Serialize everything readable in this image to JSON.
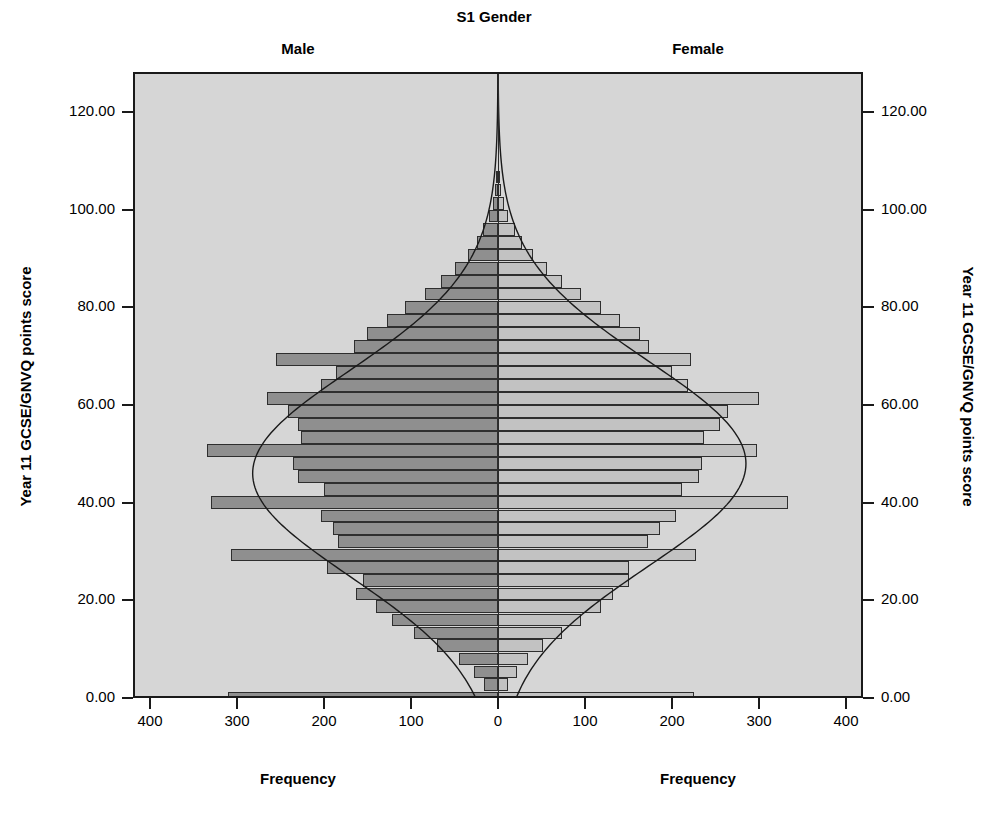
{
  "chart": {
    "title": "S1 Gender",
    "panels": [
      {
        "key": "male",
        "label": "Male",
        "xlabel": "Frequency"
      },
      {
        "key": "female",
        "label": "Female",
        "xlabel": "Frequency"
      }
    ],
    "y_axis_title_left": "Year 11 GCSE/GNVQ points score",
    "y_axis_title_right": "Year 11 GCSE/GNVQ points score",
    "y_ticks": [
      "0.00",
      "20.00",
      "40.00",
      "60.00",
      "80.00",
      "100.00",
      "120.00"
    ],
    "x_ticks_male": [
      "400",
      "300",
      "200",
      "100",
      "0"
    ],
    "x_ticks_female": [
      "0",
      "100",
      "200",
      "300",
      "400"
    ],
    "colors": {
      "male_bar": "#8f8f8f",
      "female_bar": "#c2c2c2",
      "bar_outline": "#2e2e2e",
      "plot_background": "#d6d6d6",
      "frame": "#1a1a1a",
      "curve": "#1a1a1a"
    }
  },
  "chart_data": {
    "type": "bar",
    "orientation": "horizontal",
    "subtype": "population-pyramid-back-to-back-histogram",
    "title": "S1 Gender",
    "xlabel": "Frequency",
    "ylabel": "Year 11 GCSE/GNVQ points score",
    "xlim": [
      0,
      400
    ],
    "ylim": [
      -5,
      128
    ],
    "grid": false,
    "legend_position": "none",
    "normal_curve_overlay": true,
    "bin_width": 2.7,
    "categories": [
      0.0,
      2.7,
      5.3,
      8.0,
      10.7,
      13.3,
      16.0,
      18.7,
      21.3,
      24.0,
      26.7,
      29.3,
      32.0,
      34.7,
      37.3,
      40.0,
      42.7,
      45.3,
      48.0,
      50.7,
      53.3,
      56.0,
      58.7,
      61.3,
      64.0,
      66.7,
      69.3,
      72.0,
      74.7,
      77.3,
      80.0,
      82.7,
      85.3,
      88.0,
      90.7,
      93.3,
      96.0,
      98.7,
      101.3,
      104.0,
      106.7
    ],
    "series": [
      {
        "name": "Male",
        "direction": "left",
        "values": [
          310,
          16,
          28,
          45,
          70,
          97,
          122,
          140,
          163,
          155,
          196,
          307,
          184,
          190,
          203,
          330,
          200,
          230,
          236,
          335,
          226,
          230,
          241,
          266,
          203,
          186,
          255,
          165,
          151,
          128,
          107,
          84,
          66,
          50,
          34,
          24,
          17,
          10,
          6,
          3,
          1
        ]
      },
      {
        "name": "Female",
        "direction": "right",
        "values": [
          225,
          12,
          22,
          34,
          52,
          73,
          95,
          118,
          132,
          151,
          150,
          228,
          172,
          186,
          205,
          333,
          211,
          231,
          235,
          298,
          237,
          255,
          264,
          300,
          218,
          200,
          222,
          174,
          163,
          140,
          118,
          95,
          74,
          56,
          40,
          28,
          19,
          12,
          7,
          4,
          2
        ]
      }
    ],
    "normal_curves": [
      {
        "name": "Male",
        "mean": 46.0,
        "sd": 21.0,
        "peak_frequency": 282
      },
      {
        "name": "Female",
        "mean": 48.0,
        "sd": 21.0,
        "peak_frequency": 285
      }
    ]
  }
}
